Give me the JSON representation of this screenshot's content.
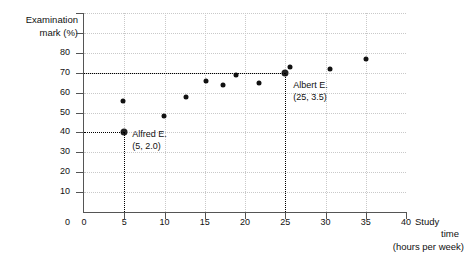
{
  "chart_data": {
    "type": "scatter",
    "title": "",
    "xlabel": "Study time (hours per week)",
    "ylabel": "Examination mark (%)",
    "xlim": [
      0,
      40
    ],
    "ylim": [
      0,
      100
    ],
    "grid": true,
    "legend": "none",
    "x_ticks": [
      "0",
      "5",
      "10",
      "15",
      "20",
      "25",
      "30",
      "35",
      "40"
    ],
    "x_tick_values": [
      0,
      5,
      10,
      15,
      20,
      25,
      30,
      35,
      40
    ],
    "y_ticks": [
      "10",
      "20",
      "30",
      "40",
      "50",
      "60",
      "70",
      "80"
    ],
    "y_tick_values": [
      10,
      20,
      30,
      40,
      50,
      60,
      70,
      80
    ],
    "y_origin_label": "0",
    "points": [
      {
        "x": 5.0,
        "y": 40
      },
      {
        "x": 4.9,
        "y": 56
      },
      {
        "x": 9.9,
        "y": 48
      },
      {
        "x": 12.7,
        "y": 58
      },
      {
        "x": 15.1,
        "y": 66
      },
      {
        "x": 17.3,
        "y": 64
      },
      {
        "x": 18.9,
        "y": 69
      },
      {
        "x": 21.8,
        "y": 65
      },
      {
        "x": 25.0,
        "y": 70
      },
      {
        "x": 25.6,
        "y": 73
      },
      {
        "x": 30.6,
        "y": 72
      },
      {
        "x": 35.0,
        "y": 77
      }
    ],
    "annotations": [
      {
        "id": "alfred",
        "name": "Alfred E.",
        "coord_label": "(5, 2.0)",
        "point_x": 5,
        "point_y": 40
      },
      {
        "id": "albert",
        "name": "Albert E.",
        "coord_label": "(25, 3.5)",
        "point_x": 25,
        "point_y": 70
      }
    ],
    "guide_lines": [
      {
        "id": "alfred-horizontal",
        "orientation": "horizontal",
        "value": 40,
        "from_x": 0,
        "to_x": 5
      },
      {
        "id": "alfred-vertical",
        "orientation": "vertical",
        "value": 5,
        "from_y": 0,
        "to_y": 40
      },
      {
        "id": "albert-horizontal",
        "orientation": "horizontal",
        "value": 70,
        "from_x": 0,
        "to_x": 25
      },
      {
        "id": "albert-vertical",
        "orientation": "vertical",
        "value": 25,
        "from_y": 0,
        "to_y": 70
      }
    ],
    "axis_title_y_lines": [
      "Examination",
      "mark (%)"
    ],
    "axis_title_x_lines": [
      "Study",
      "time",
      "(hours per week)"
    ],
    "colors": {
      "point": "#111111",
      "axis": "#555555",
      "grid": "#c9c9c9",
      "guide": "#000000",
      "background": "#ffffff",
      "text": "#111111"
    }
  }
}
